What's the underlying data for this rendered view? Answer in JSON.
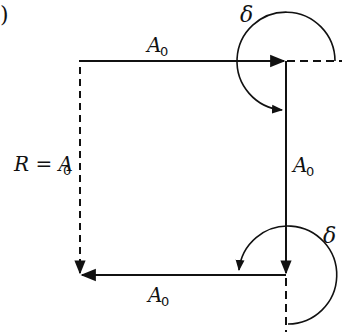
{
  "figure": {
    "panel_label": ")",
    "colors": {
      "stroke": "#111111",
      "background": "#ffffff"
    },
    "vectors": [
      {
        "id": "top",
        "label_main": "A",
        "label_sub": "0",
        "style": "solid",
        "direction": "right"
      },
      {
        "id": "right",
        "label_main": "A",
        "label_sub": "0",
        "style": "solid",
        "direction": "down"
      },
      {
        "id": "bottom",
        "label_main": "A",
        "label_sub": "0",
        "style": "solid",
        "direction": "left"
      },
      {
        "id": "resultant",
        "label_main": "R = A",
        "label_sub": "0",
        "style": "dashed",
        "direction": "down"
      }
    ],
    "angles": [
      {
        "id": "top-angle",
        "symbol": "δ"
      },
      {
        "id": "bottom-angle",
        "symbol": "δ"
      }
    ]
  }
}
